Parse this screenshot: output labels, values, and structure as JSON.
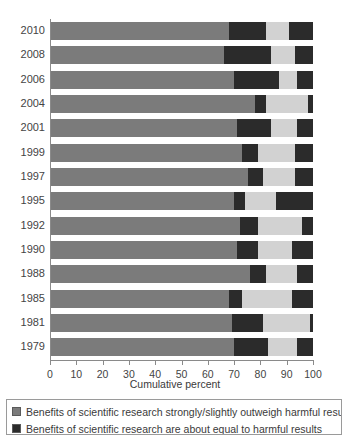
{
  "chart_data": {
    "type": "bar",
    "orientation": "horizontal",
    "stacked": true,
    "title": "",
    "xlabel": "Cumulative percent",
    "ylabel": "",
    "xlim": [
      0,
      100
    ],
    "xticks": [
      0,
      10,
      20,
      30,
      40,
      50,
      60,
      70,
      80,
      90,
      100
    ],
    "grid": false,
    "legend_position": "bottom",
    "categories": [
      "2010",
      "2008",
      "2006",
      "2004",
      "2001",
      "1999",
      "1997",
      "1995",
      "1992",
      "1990",
      "1988",
      "1985",
      "1981",
      "1979"
    ],
    "series": [
      {
        "name": "Benefits of scientific research strongly/slightly outweigh harmful results",
        "color": "#7b7b7b",
        "values": [
          68,
          66,
          70,
          78,
          71,
          73,
          75,
          70,
          72,
          71,
          76,
          68,
          69,
          70
        ]
      },
      {
        "name": "Benefits of scientific research are about equal to harmful results",
        "color": "#2b2b2b",
        "values": [
          14,
          18,
          17,
          4,
          13,
          6,
          6,
          4,
          7,
          8,
          6,
          5,
          12,
          13
        ]
      },
      {
        "name": "Harmful results of scientific research strongly/slightly outweigh benefits",
        "color": "#d2d2d2",
        "values": [
          9,
          9,
          7,
          16,
          10,
          14,
          12,
          12,
          17,
          13,
          12,
          19,
          18,
          11
        ]
      },
      {
        "name": "Don't know",
        "color": "#2b2b2b",
        "values": [
          9,
          7,
          6,
          2,
          6,
          7,
          7,
          14,
          4,
          8,
          6,
          8,
          1,
          6
        ]
      }
    ],
    "cumulative_breaks": {
      "2010": [
        68,
        82,
        91,
        100
      ],
      "2008": [
        66,
        84,
        93,
        100
      ],
      "2006": [
        70,
        87,
        94,
        100
      ],
      "2004": [
        78,
        82,
        98,
        100
      ],
      "2001": [
        71,
        84,
        94,
        100
      ],
      "1999": [
        73,
        79,
        93,
        100
      ],
      "1997": [
        75,
        81,
        93,
        100
      ],
      "1995": [
        70,
        74,
        86,
        100
      ],
      "1992": [
        72,
        79,
        96,
        100
      ],
      "1990": [
        71,
        79,
        92,
        100
      ],
      "1988": [
        76,
        82,
        94,
        100
      ],
      "1985": [
        68,
        73,
        92,
        100
      ],
      "1981": [
        69,
        81,
        99,
        100
      ],
      "1979": [
        70,
        83,
        94,
        100
      ]
    }
  },
  "axis": {
    "x_title": "Cumulative percent",
    "tick_labels": [
      "0",
      "10",
      "20",
      "30",
      "40",
      "50",
      "60",
      "70",
      "80",
      "90",
      "100"
    ]
  },
  "legend": {
    "items": [
      {
        "swatch_color": "#7b7b7b",
        "label": "Benefits of scientific research strongly/slightly outweigh harmful results"
      },
      {
        "swatch_color": "#2b2b2b",
        "label": "Benefits of scientific research are about equal to harmful results"
      }
    ]
  },
  "colors": {
    "segment_a": "#7b7b7b",
    "segment_b": "#2b2b2b",
    "segment_c": "#d2d2d2",
    "segment_d": "#2b2b2b",
    "axis": "#8a8a8a",
    "text": "#3a3a3a",
    "background": "#ffffff"
  }
}
